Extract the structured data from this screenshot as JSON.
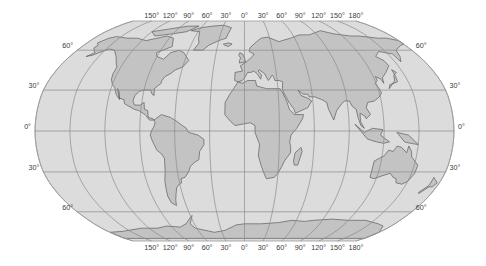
{
  "map": {
    "projection": "Robinson",
    "colors": {
      "ocean": "#dcdcdc",
      "land": "#c3c3c3",
      "coast": "#4a4a4a",
      "graticule": "#8a8a8a",
      "outline": "#9a9a9a",
      "label": "#3a3a3a",
      "background": "#ffffff"
    },
    "geometry": {
      "center_x": 244.5,
      "equator_y": 131,
      "half_width": 209.5,
      "pole_y_top": 22,
      "pole_y_bottom": 242
    },
    "longitude_labels_top": [
      "150°",
      "120°",
      "90°",
      "60°",
      "30°",
      "0°",
      "30°",
      "60°",
      "90°",
      "120°",
      "150°",
      "180°"
    ],
    "longitude_labels_bottom": [
      "150°",
      "120°",
      "90°",
      "60°",
      "30°",
      "0°",
      "30°",
      "60°",
      "90°",
      "120°",
      "150°",
      "180°"
    ],
    "latitude_labels_left": [
      "60°",
      "30°",
      "0°",
      "30°",
      "60°"
    ],
    "latitude_labels_right": [
      "60°",
      "30°",
      "0°",
      "30°",
      "60°"
    ],
    "meridians_deg": [
      -180,
      -150,
      -120,
      -90,
      -60,
      -30,
      0,
      30,
      60,
      90,
      120,
      150,
      180
    ],
    "parallels_deg": [
      60,
      30,
      0,
      -30,
      -60
    ],
    "continents": [
      "North America",
      "Greenland",
      "South America",
      "Europe",
      "Africa",
      "Asia",
      "Australia",
      "Antarctica",
      "Madagascar",
      "New Zealand"
    ]
  }
}
